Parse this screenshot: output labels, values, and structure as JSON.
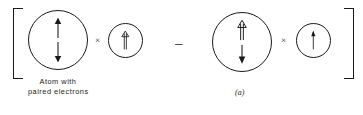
{
  "figure": {
    "label": "(a)",
    "background_color": "#ffffff",
    "ink_color": "#1a1a1a"
  },
  "brackets": {
    "left": "[",
    "right": "]"
  },
  "operators": {
    "times_1": "×",
    "times_2": "×",
    "minus": "–"
  },
  "caption": {
    "line1": "Atom with",
    "line2": "paired electrons"
  },
  "atoms": [
    {
      "id": "atom-1",
      "size": "big",
      "arrows": [
        {
          "name": "spin-up-arrow",
          "direction": "up",
          "style": "single"
        },
        {
          "name": "spin-down-arrow",
          "direction": "down",
          "style": "single"
        }
      ]
    },
    {
      "id": "atom-2",
      "size": "small",
      "arrows": [
        {
          "name": "spin-up-arrow",
          "direction": "up",
          "style": "double"
        }
      ]
    },
    {
      "id": "atom-3",
      "size": "big",
      "arrows": [
        {
          "name": "spin-up-arrow",
          "direction": "up",
          "style": "double"
        },
        {
          "name": "spin-down-arrow",
          "direction": "down",
          "style": "single"
        }
      ]
    },
    {
      "id": "atom-4",
      "size": "small",
      "arrows": [
        {
          "name": "spin-up-arrow",
          "direction": "up",
          "style": "single"
        }
      ]
    }
  ]
}
